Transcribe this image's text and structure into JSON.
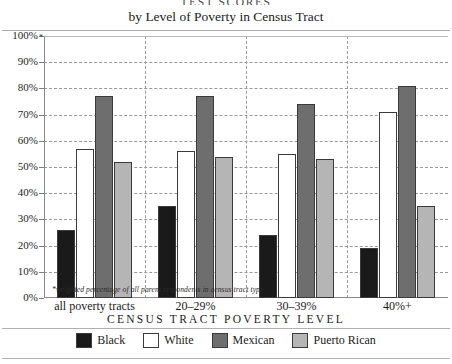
{
  "header": {
    "main_title": "TEST SCORES",
    "subtitle": "by Level of Poverty in Census Tract"
  },
  "footnote": "*weighted percentage of all parent respondents in census tract type",
  "axis_note_marker": "*",
  "legend": {
    "title": "CENSUS TRACT POVERTY LEVEL",
    "items": [
      {
        "label": "Black",
        "color": "#1a1a1a"
      },
      {
        "label": "White",
        "color": "#ffffff"
      },
      {
        "label": "Mexican",
        "color": "#6e6e6e"
      },
      {
        "label": "Puerto Rican",
        "color": "#b5b5b5"
      }
    ]
  },
  "chart_data": {
    "type": "bar",
    "title": "by Level of Poverty in Census Tract",
    "xlabel": "CENSUS TRACT POVERTY LEVEL",
    "ylabel": "",
    "ylim": [
      0,
      100
    ],
    "ytick_labels": [
      "0%",
      "10%",
      "20%",
      "30%",
      "40%",
      "50%",
      "60%",
      "70%",
      "80%",
      "90%",
      "100%"
    ],
    "ytick_values": [
      0,
      10,
      20,
      30,
      40,
      50,
      60,
      70,
      80,
      90,
      100
    ],
    "grid": true,
    "legend_position": "bottom",
    "categories": [
      "all poverty tracts",
      "20–29%",
      "30–39%",
      "40%+"
    ],
    "series": [
      {
        "name": "Black",
        "color": "#1a1a1a",
        "values": [
          26,
          35,
          24,
          19
        ]
      },
      {
        "name": "White",
        "color": "#ffffff",
        "values": [
          57,
          56,
          55,
          71
        ]
      },
      {
        "name": "Mexican",
        "color": "#6e6e6e",
        "values": [
          77,
          77,
          74,
          81
        ]
      },
      {
        "name": "Puerto Rican",
        "color": "#b5b5b5",
        "values": [
          52,
          54,
          53,
          35
        ]
      }
    ]
  }
}
